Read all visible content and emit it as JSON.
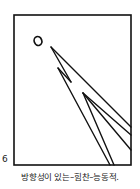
{
  "figure": {
    "number": "6",
    "caption": "방향성이 있는–힘찬–능동적.",
    "stroke_color": "#111111",
    "frame": {
      "x": 14,
      "y": 15,
      "width": 117,
      "height": 150
    },
    "circle": {
      "label": "O",
      "cx": 38,
      "cy": 41,
      "rx": 3.8,
      "ry": 4.5
    },
    "lines": [
      {
        "from": [
          51,
          47
        ],
        "to": [
          131,
          127
        ]
      },
      {
        "from": [
          51,
          47
        ],
        "to": [
          71,
          82
        ]
      },
      {
        "from": [
          71,
          82
        ],
        "to": [
          58,
          68
        ]
      },
      {
        "from": [
          58,
          68
        ],
        "to": [
          110,
          165
        ]
      },
      {
        "from": [
          83,
          93
        ],
        "to": [
          131,
          135
        ]
      },
      {
        "from": [
          83,
          93
        ],
        "to": [
          131,
          150
        ]
      },
      {
        "from": [
          83,
          93
        ],
        "to": [
          114,
          165
        ]
      }
    ]
  }
}
